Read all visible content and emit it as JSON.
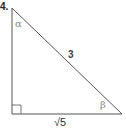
{
  "problem": {
    "number": "4.",
    "figure": "right-triangle",
    "labels": {
      "angle_top": "α",
      "angle_bottom_right": "β",
      "hypotenuse": "3",
      "base": "√5"
    },
    "right_angle_vertex": "bottom-left",
    "line_color": "#555555"
  }
}
